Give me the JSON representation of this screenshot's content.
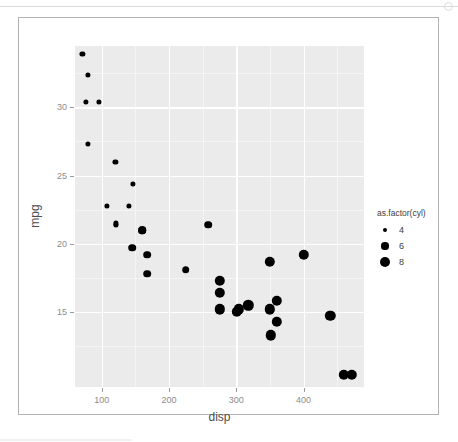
{
  "device": {
    "top_glyph_icon": "circle-icon",
    "background_color": "#ffffff",
    "border_color": "#b3b3b3"
  },
  "chart_data": {
    "type": "scatter",
    "title": "",
    "xlabel": "disp",
    "ylabel": "mpg",
    "xlim": [
      60,
      490
    ],
    "ylim": [
      9.5,
      34.5
    ],
    "xticks": [
      100,
      200,
      300,
      400
    ],
    "yticks": [
      15,
      20,
      25,
      30
    ],
    "xminor": [
      150,
      250,
      350,
      450
    ],
    "yminor": [
      12.5,
      17.5,
      22.5,
      27.5,
      32.5
    ],
    "grid": true,
    "panel_color": "#ebebeb",
    "gridline_color": "#ffffff",
    "point_color": "#000000",
    "legend": {
      "position": "right",
      "title": "as.factor(cyl)",
      "entries": [
        {
          "label": "4",
          "size_px": 2.4
        },
        {
          "label": "6",
          "size_px": 3.6
        },
        {
          "label": "8",
          "size_px": 5.4
        }
      ]
    },
    "series": [
      {
        "name": "4",
        "cyl": 4,
        "point_size_px": 2.6,
        "points": [
          {
            "x": 71.1,
            "y": 33.9
          },
          {
            "x": 78.7,
            "y": 32.4
          },
          {
            "x": 75.7,
            "y": 30.4
          },
          {
            "x": 95.1,
            "y": 30.4
          },
          {
            "x": 79.0,
            "y": 27.3
          },
          {
            "x": 120.1,
            "y": 26.0
          },
          {
            "x": 146.7,
            "y": 24.4
          },
          {
            "x": 108.0,
            "y": 22.8
          },
          {
            "x": 140.8,
            "y": 22.8
          },
          {
            "x": 121.0,
            "y": 21.4
          },
          {
            "x": 120.3,
            "y": 21.5
          }
        ]
      },
      {
        "name": "6",
        "cyl": 6,
        "point_size_px": 3.8,
        "points": [
          {
            "x": 160.0,
            "y": 21.0
          },
          {
            "x": 160.0,
            "y": 21.0
          },
          {
            "x": 167.6,
            "y": 19.2
          },
          {
            "x": 167.6,
            "y": 17.8
          },
          {
            "x": 145.0,
            "y": 19.7
          },
          {
            "x": 225.0,
            "y": 18.1
          },
          {
            "x": 258.0,
            "y": 21.4
          }
        ]
      },
      {
        "name": "8",
        "cyl": 8,
        "point_size_px": 5.2,
        "points": [
          {
            "x": 360.0,
            "y": 14.3
          },
          {
            "x": 360.0,
            "y": 15.8
          },
          {
            "x": 275.8,
            "y": 17.3
          },
          {
            "x": 275.8,
            "y": 16.4
          },
          {
            "x": 275.8,
            "y": 15.2
          },
          {
            "x": 472.0,
            "y": 10.4
          },
          {
            "x": 460.0,
            "y": 10.4
          },
          {
            "x": 440.0,
            "y": 14.7
          },
          {
            "x": 318.0,
            "y": 15.5
          },
          {
            "x": 304.0,
            "y": 15.2
          },
          {
            "x": 350.0,
            "y": 15.2
          },
          {
            "x": 400.0,
            "y": 19.2
          },
          {
            "x": 351.0,
            "y": 13.3
          },
          {
            "x": 301.0,
            "y": 15.0
          },
          {
            "x": 350.0,
            "y": 18.7
          }
        ]
      }
    ]
  }
}
